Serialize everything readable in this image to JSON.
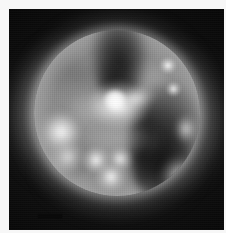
{
  "figure": {
    "kind": "solar-coronal-image",
    "caption": "",
    "frame": {
      "width_px": 226,
      "height_px": 233,
      "mat_color": "#f7f7f7",
      "image_left_px": 9,
      "image_top_px": 9,
      "image_width_px": 215,
      "image_height_px": 221
    },
    "colormap": "grayscale",
    "background_color": "#050505",
    "sun": {
      "disk_center_x_px": 108,
      "disk_center_y_px": 104,
      "disk_radius_px": 83,
      "disk_label": "solar disk",
      "limb_brightening": true
    },
    "features": [
      {
        "id": "polar-coronal-hole",
        "label": "north polar coronal hole",
        "tone": "dark",
        "center_x_px": 85,
        "center_y_px": 27
      },
      {
        "id": "east-coronal-hole",
        "label": "east-limb coronal hole",
        "tone": "dark",
        "center_x_px": 158,
        "center_y_px": 130
      },
      {
        "id": "central-active-region",
        "label": "central active region complex",
        "tone": "bright",
        "center_x_px": 110,
        "center_y_px": 95
      },
      {
        "id": "west-limb-active-region",
        "label": "west limb active region",
        "tone": "bright",
        "center_x_px": 50,
        "center_y_px": 125
      },
      {
        "id": "southern-loop-group",
        "label": "southern loop group",
        "tone": "bright",
        "center_x_px": 105,
        "center_y_px": 155
      },
      {
        "id": "northeast-bright-point-upper",
        "label": "northeast bright point",
        "tone": "bright",
        "center_x_px": 168,
        "center_y_px": 66
      },
      {
        "id": "northeast-bright-point-lower",
        "label": "northeast bright point",
        "tone": "bright",
        "center_x_px": 174,
        "center_y_px": 90
      }
    ],
    "scale_bar": {
      "label": "",
      "visible": true,
      "position": "bottom-left",
      "length_px": 24,
      "thickness_px": 4,
      "color": "#0a0a0a"
    }
  }
}
